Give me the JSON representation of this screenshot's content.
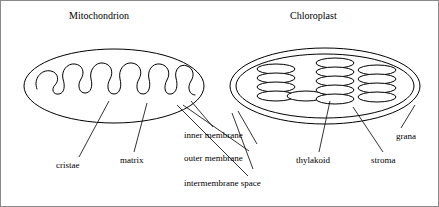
{
  "figure": {
    "background_color": "#ffffff",
    "stroke_color": "#000000",
    "border_color": "#8a8a8a",
    "width": 439,
    "height": 207
  },
  "panels": [
    {
      "id": "mitochondrion",
      "title": "Mitochondrion",
      "title_x": 68,
      "title_y": 10
    },
    {
      "id": "chloroplast",
      "title": "Chloroplast",
      "title_x": 289,
      "title_y": 10
    }
  ],
  "labels": [
    {
      "id": "cristae",
      "text": "cristae",
      "x": 55,
      "y": 160
    },
    {
      "id": "matrix",
      "text": "matrix",
      "x": 119,
      "y": 155
    },
    {
      "id": "inner-membrane",
      "text": "inner membrane",
      "x": 183,
      "y": 130
    },
    {
      "id": "outer-membrane",
      "text": "outer membrane",
      "x": 183,
      "y": 153
    },
    {
      "id": "intermembrane-space",
      "text": "intermembrane space",
      "x": 183,
      "y": 178
    },
    {
      "id": "thylakoid",
      "text": "thylakoid",
      "x": 295,
      "y": 155
    },
    {
      "id": "stroma",
      "text": "stroma",
      "x": 370,
      "y": 155
    },
    {
      "id": "grana",
      "text": "grana",
      "x": 395,
      "y": 131
    }
  ],
  "mitochondrion_geometry": {
    "outer_ellipse": {
      "cx": 113,
      "cy": 85,
      "rx": 90,
      "ry": 37
    },
    "cristae_path": "M 36 88 C 32 78 40 68 50 70 C 58 72 58 80 54 84 C 50 88 52 94 58 93 C 64 92 64 84 62 78 C 60 70 66 62 74 63 C 82 64 84 72 80 78 C 76 84 78 92 84 92 C 90 92 92 85 90 78 C 88 70 94 61 102 62 C 110 63 113 71 109 78 C 105 85 107 93 113 93 C 119 93 121 85 119 78 C 117 69 123 61 131 62 C 139 63 142 71 138 78 C 134 85 136 93 142 93 C 148 93 150 85 148 78 C 146 70 151 62 159 63 C 167 64 170 72 166 79 C 162 86 164 94 170 93 C 176 92 177 84 175 77 C 173 69 179 62 186 65 C 192 67 194 74 190 80 C 186 86 188 94 194 94"
  },
  "chloroplast_geometry": {
    "outer_ellipse": {
      "cx": 324,
      "cy": 85,
      "rx": 95,
      "ry": 38
    },
    "inner_ellipse": {
      "cx": 324,
      "cy": 85,
      "rx": 89,
      "ry": 32
    },
    "disc_rx": 19,
    "disc_ry": 5,
    "grana_stacks": [
      {
        "id": "granum-left",
        "cx": 275,
        "disc_count": 4,
        "top_cy": 68
      },
      {
        "id": "granum-middle",
        "cx": 334,
        "disc_count": 5,
        "top_cy": 62
      },
      {
        "id": "granum-right",
        "cx": 376,
        "disc_count": 4,
        "top_cy": 68
      }
    ],
    "lamellae": [
      {
        "id": "stroma-lamella-left",
        "cx": 305,
        "cy": 95
      }
    ]
  },
  "leader_lines": [
    {
      "id": "leader-cristae",
      "x1": 78,
      "y1": 156,
      "x2": 108,
      "y2": 100
    },
    {
      "id": "leader-matrix",
      "x1": 133,
      "y1": 151,
      "x2": 146,
      "y2": 102
    },
    {
      "id": "leader-inner-membrane",
      "x1": 212,
      "y1": 126,
      "x2": 190,
      "y2": 100
    },
    {
      "id": "leader-outer-membrane",
      "x1": 248,
      "y1": 150,
      "x2": 182,
      "y2": 104
    },
    {
      "id": "leader-intermembrane-space",
      "x1": 247,
      "y1": 175,
      "x2": 176,
      "y2": 104
    },
    {
      "id": "leader-thylakoid",
      "x1": 318,
      "y1": 151,
      "x2": 329,
      "y2": 100
    },
    {
      "id": "leader-stroma",
      "x1": 382,
      "y1": 151,
      "x2": 352,
      "y2": 106
    },
    {
      "id": "leader-grana",
      "x1": 400,
      "y1": 127,
      "x2": 414,
      "y2": 104
    }
  ]
}
